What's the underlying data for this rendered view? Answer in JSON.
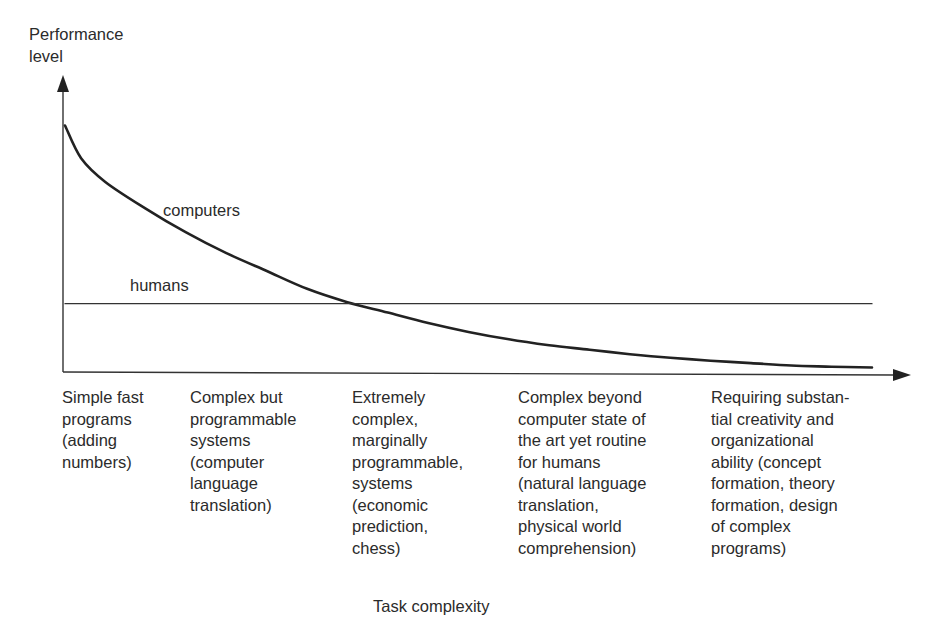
{
  "chart_data": {
    "type": "line",
    "title": "",
    "ylabel": "Performance\nlevel",
    "xlabel": "Task complexity",
    "grid": false,
    "legend": "inline labels",
    "xlim": [
      0,
      1
    ],
    "ylim": [
      0,
      1
    ],
    "categories": [
      "Simple fast\nprograms\n(adding\nnumbers)",
      "Complex but\nprogrammable\nsystems\n(computer\nlanguage\ntranslation)",
      "Extremely\ncomplex,\nmarginally\nprogrammable,\nsystems\n(economic\nprediction,\nchess)",
      "Complex beyond\ncomputer state of\nthe art yet routine\nfor humans\n(natural language\ntranslation,\nphysical world\ncomprehension)",
      "Requiring substan-\ntial creativity and\norganizational\nability (concept\nformation, theory\nformation, design\nof complex\nprograms)"
    ],
    "series": [
      {
        "name": "computers",
        "color": "#222222",
        "x": [
          0.0,
          0.02,
          0.05,
          0.1,
          0.15,
          0.2,
          0.25,
          0.3,
          0.35,
          0.4,
          0.45,
          0.5,
          0.55,
          0.6,
          0.65,
          0.7,
          0.75,
          0.8,
          0.85,
          0.9,
          0.95,
          1.0
        ],
        "y": [
          0.83,
          0.72,
          0.64,
          0.55,
          0.47,
          0.4,
          0.34,
          0.28,
          0.235,
          0.2,
          0.165,
          0.135,
          0.11,
          0.09,
          0.075,
          0.06,
          0.048,
          0.038,
          0.03,
          0.022,
          0.018,
          0.015
        ]
      },
      {
        "name": "humans",
        "color": "#333333",
        "x": [
          0.0,
          1.0
        ],
        "y": [
          0.23,
          0.23
        ]
      }
    ]
  }
}
